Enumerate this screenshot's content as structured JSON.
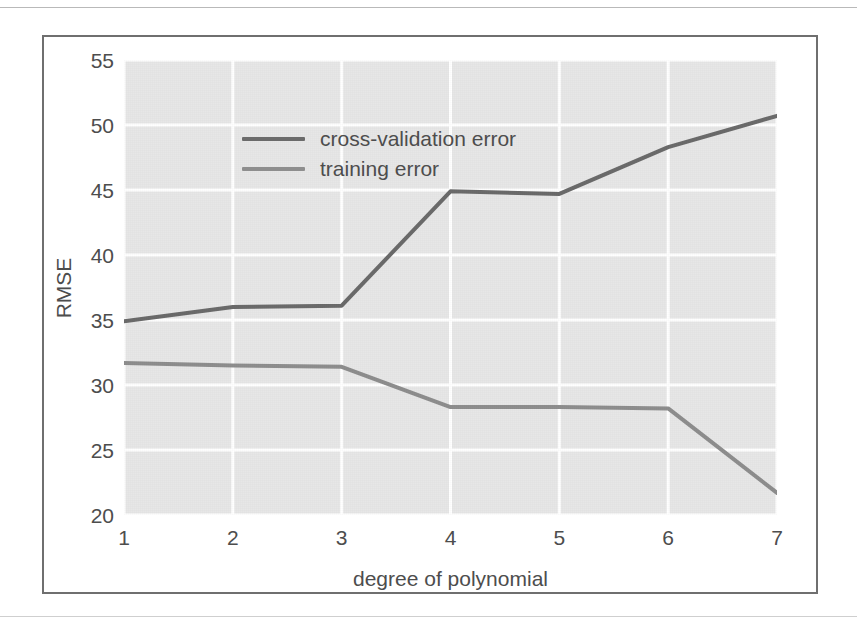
{
  "figure": {
    "background_color": "#ffffff",
    "frame_color": "#6f6f6f",
    "plot_background_color": "#e7e7e7",
    "grid_color": "#ffffff"
  },
  "axes": {
    "y_title": "RMSE",
    "x_title": "degree of polynomial",
    "y_ticks": [
      "55",
      "50",
      "45",
      "40",
      "35",
      "30",
      "25",
      "20"
    ],
    "x_ticks": [
      "1",
      "2",
      "3",
      "4",
      "5",
      "6",
      "7"
    ]
  },
  "legend": {
    "position": "upper-left",
    "entries": [
      {
        "label": "cross-validation error",
        "color": "#6b6b6b"
      },
      {
        "label": "training error",
        "color": "#8e8e8e"
      }
    ]
  },
  "chart_data": {
    "type": "line",
    "title": "",
    "xlabel": "degree of polynomial",
    "ylabel": "RMSE",
    "x": [
      1,
      2,
      3,
      4,
      5,
      6,
      7
    ],
    "xlim": [
      1,
      7
    ],
    "ylim": [
      20,
      55
    ],
    "yticks": [
      20,
      25,
      30,
      35,
      40,
      45,
      50,
      55
    ],
    "xticks": [
      1,
      2,
      3,
      4,
      5,
      6,
      7
    ],
    "grid": true,
    "legend_position": "upper left",
    "series": [
      {
        "name": "cross-validation error",
        "color": "#6b6b6b",
        "linewidth": 4,
        "values": [
          34.9,
          36.0,
          36.1,
          44.9,
          44.7,
          48.3,
          50.7
        ]
      },
      {
        "name": "training error",
        "color": "#8e8e8e",
        "linewidth": 4,
        "values": [
          31.7,
          31.5,
          31.4,
          28.3,
          28.3,
          28.2,
          21.7
        ]
      }
    ]
  }
}
